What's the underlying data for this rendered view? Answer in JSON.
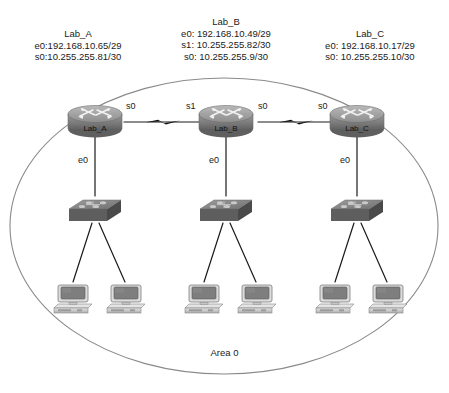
{
  "diagram": {
    "area_label": "Area 0",
    "routers": [
      {
        "id": "lab-a",
        "name": "Lab_A",
        "icon": "router-icon",
        "info_lines": [
          "e0:192.168.10.65/29",
          "s0:10.255.255.81/30"
        ],
        "interfaces": {
          "serial_right": "s0",
          "ethernet_down": "e0"
        }
      },
      {
        "id": "lab-b",
        "name": "Lab_B",
        "icon": "router-icon",
        "info_lines": [
          "e0: 192.168.10.49/29",
          "s1: 10.255.255.82/30",
          "s0: 10.255.255.9/30"
        ],
        "interfaces": {
          "serial_left": "s1",
          "serial_right": "s0",
          "ethernet_down": "e0"
        }
      },
      {
        "id": "lab-c",
        "name": "Lab_C",
        "icon": "router-icon",
        "info_lines": [
          "e0: 192.168.10.17/29",
          "s0: 10.255.255.10/30"
        ],
        "interfaces": {
          "serial_left": "s0",
          "ethernet_down": "e0"
        }
      }
    ],
    "switches": [
      {
        "id": "switch-a",
        "icon": "switch-icon",
        "host_count": 2
      },
      {
        "id": "switch-b",
        "icon": "switch-icon",
        "host_count": 2
      },
      {
        "id": "switch-c",
        "icon": "switch-icon",
        "host_count": 2
      }
    ],
    "hosts": [
      {
        "id": "pc-a1",
        "icon": "pc-icon"
      },
      {
        "id": "pc-a2",
        "icon": "pc-icon"
      },
      {
        "id": "pc-b1",
        "icon": "pc-icon"
      },
      {
        "id": "pc-b2",
        "icon": "pc-icon"
      },
      {
        "id": "pc-c1",
        "icon": "pc-icon"
      },
      {
        "id": "pc-c2",
        "icon": "pc-icon"
      }
    ],
    "links": [
      {
        "id": "serial-ab",
        "type": "serial",
        "from": "lab-a",
        "to": "lab-b",
        "icon": "lightning-bolt-icon"
      },
      {
        "id": "serial-bc",
        "type": "serial",
        "from": "lab-b",
        "to": "lab-c",
        "icon": "lightning-bolt-icon"
      }
    ],
    "boundary": {
      "shape": "ellipse",
      "name": "ospf-area-boundary"
    }
  },
  "colors": {
    "line": "#1a1a1a",
    "boundary": "#8a8a8a",
    "device_dark": "#5c5c5c",
    "device_mid": "#8f8f8f",
    "device_light": "#bdbdbd",
    "pc_light": "#d6d6d6",
    "pc_screen": "#808080",
    "text": "#1a1a1a"
  }
}
